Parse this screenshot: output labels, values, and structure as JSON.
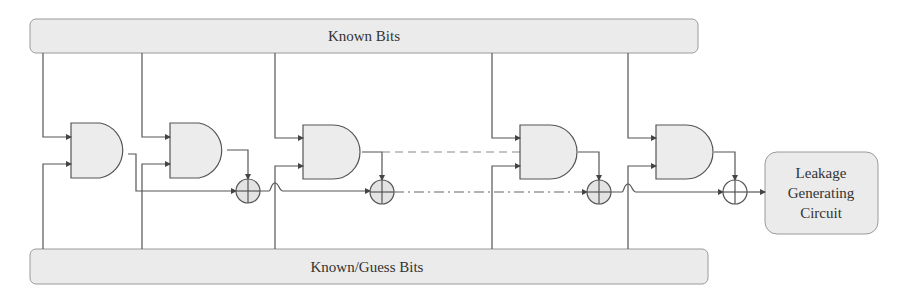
{
  "diagram": {
    "top_bus": {
      "label": "Known Bits"
    },
    "bottom_bus": {
      "label": "Known/Guess Bits"
    },
    "output_box": {
      "lines": [
        "Leakage",
        "Generating",
        "Circuit"
      ]
    },
    "gates": [
      {
        "type": "AND",
        "index": 1
      },
      {
        "type": "AND",
        "index": 2
      },
      {
        "type": "AND",
        "index": 3
      },
      {
        "type": "AND",
        "index": 4
      },
      {
        "type": "AND",
        "index": 5
      }
    ],
    "xors": [
      {
        "type": "XOR",
        "index": 1
      },
      {
        "type": "XOR",
        "index": 2
      },
      {
        "type": "XOR",
        "index": 3
      },
      {
        "type": "XOR",
        "index": 4
      }
    ],
    "colors": {
      "stroke": "#555555",
      "fill": "#ececec",
      "bus_fill": "#eaeaea",
      "text": "#333333"
    }
  }
}
